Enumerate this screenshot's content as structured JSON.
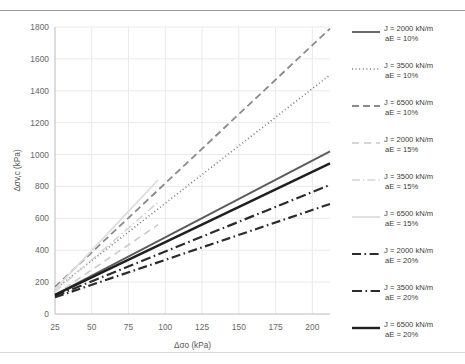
{
  "chart_data": {
    "type": "line",
    "title": "",
    "xlabel": "Δσo (kPa)",
    "ylabel": "Δσv,c (kPa)",
    "xlim": [
      25,
      212
    ],
    "ylim": [
      0,
      1800
    ],
    "xticks": [
      25,
      50,
      75,
      100,
      125,
      150,
      175,
      200
    ],
    "yticks": [
      0,
      200,
      400,
      600,
      800,
      1000,
      1200,
      1400,
      1600,
      1800
    ],
    "grid": true,
    "legend_position": "right",
    "series": [
      {
        "name": "J = 2000 kN/m aE = 10%",
        "label_line1": "J = 2000 kN/m",
        "label_line2": "aE = 10%",
        "style": "solid",
        "color": "#5a5a5a",
        "width": 1.8,
        "x": [
          25,
          212
        ],
        "y": [
          120,
          1020
        ]
      },
      {
        "name": "J = 3500 kN/m aE = 10%",
        "label_line1": "J = 3500 kN/m",
        "label_line2": "aE = 10%",
        "style": "dotted",
        "color": "#7a7a7a",
        "width": 1.6,
        "x": [
          25,
          212
        ],
        "y": [
          155,
          1500
        ]
      },
      {
        "name": "J = 6500 kN/m aE = 10%",
        "label_line1": "J = 6500 kN/m",
        "label_line2": "aE = 10%",
        "style": "dashed",
        "color": "#8a8a8a",
        "width": 1.8,
        "x": [
          25,
          212
        ],
        "y": [
          170,
          1790
        ]
      },
      {
        "name": "J = 2000 kN/m aE = 15%",
        "label_line1": "J = 2000 kN/m",
        "label_line2": "aE = 15%",
        "style": "dashed-light",
        "color": "#c9c9c9",
        "width": 1.6,
        "x": [
          25,
          95
        ],
        "y": [
          120,
          560
        ]
      },
      {
        "name": "J = 3500 kN/m aE = 15%",
        "label_line1": "J = 3500 kN/m",
        "label_line2": "aE = 15%",
        "style": "dashdot-light",
        "color": "#d5d5d5",
        "width": 1.6,
        "x": [
          25,
          95
        ],
        "y": [
          140,
          700
        ]
      },
      {
        "name": "J = 6500 kN/m aE = 15%",
        "label_line1": "J = 6500 kN/m",
        "label_line2": "aE = 15%",
        "style": "solid-light",
        "color": "#dedede",
        "width": 1.8,
        "x": [
          25,
          95
        ],
        "y": [
          155,
          840
        ]
      },
      {
        "name": "J = 2000 kN/m aE = 20%",
        "label_line1": "J = 2000 kN/m",
        "label_line2": "aE = 20%",
        "style": "dashdot-dark",
        "color": "#2b2b2b",
        "width": 2.2,
        "x": [
          25,
          212
        ],
        "y": [
          105,
          690
        ]
      },
      {
        "name": "J = 3500 kN/m aE = 20%",
        "label_line1": "J = 3500 kN/m",
        "label_line2": "aE = 20%",
        "style": "dashdot-dark2",
        "color": "#2b2b2b",
        "width": 2.2,
        "x": [
          25,
          212
        ],
        "y": [
          112,
          810
        ]
      },
      {
        "name": "J = 6500 kN/m aE = 20%",
        "label_line1": "J = 6500 kN/m",
        "label_line2": "aE = 20%",
        "style": "solid-dark",
        "color": "#1f1f1f",
        "width": 2.4,
        "x": [
          25,
          212
        ],
        "y": [
          120,
          945
        ]
      }
    ]
  },
  "axes": {
    "xlabel": "Δσo (kPa)",
    "ylabel": "Δσv,c (kPa)"
  },
  "colors": {
    "grid": "#eaeaea",
    "axis": "#c4c4c4",
    "text": "#666666",
    "top_rule": "#9a9a9a"
  }
}
